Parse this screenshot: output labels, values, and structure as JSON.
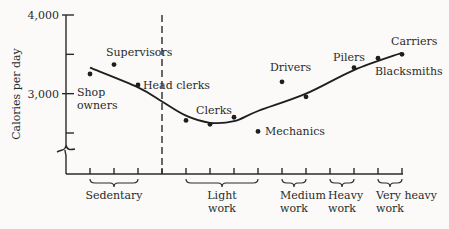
{
  "chart_data": {
    "type": "scatter",
    "title": "",
    "xlabel": "",
    "ylabel": "Calories per day",
    "y_ticks": [
      {
        "value": 4000,
        "label": "4,000"
      },
      {
        "value": 3500,
        "label": ""
      },
      {
        "value": 3000,
        "label": "3,000"
      },
      {
        "value": 2500,
        "label": ""
      }
    ],
    "ylim": [
      2500,
      4000
    ],
    "y_axis_break": true,
    "x_ticks": [
      1,
      2,
      3,
      4,
      5,
      6,
      7,
      8,
      9,
      10,
      11,
      12,
      13,
      14
    ],
    "divider_x": 4,
    "groups": [
      {
        "label": "Sedentary",
        "from": 1,
        "to": 3
      },
      {
        "label": "Light\nwork",
        "from": 5,
        "to": 8
      },
      {
        "label": "Medium\nwork",
        "from": 9,
        "to": 10
      },
      {
        "label": "Heavy\nwork",
        "from": 11,
        "to": 12
      },
      {
        "label": "Very heavy\nwork",
        "from": 13,
        "to": 14
      }
    ],
    "points": [
      {
        "x": 1,
        "y": 3250,
        "label": "Shop\nowners"
      },
      {
        "x": 2,
        "y": 3370,
        "label": "Supervisors"
      },
      {
        "x": 3,
        "y": 3110,
        "label": "Head clerks"
      },
      {
        "x": 5,
        "y": 2660,
        "label": ""
      },
      {
        "x": 6,
        "y": 2610,
        "label": "Clerks"
      },
      {
        "x": 7,
        "y": 2700,
        "label": ""
      },
      {
        "x": 8,
        "y": 2520,
        "label": "Mechanics"
      },
      {
        "x": 9,
        "y": 3150,
        "label": "Drivers"
      },
      {
        "x": 10,
        "y": 2960,
        "label": ""
      },
      {
        "x": 12,
        "y": 3330,
        "label": "Pilers"
      },
      {
        "x": 13,
        "y": 3450,
        "label": "Blacksmiths"
      },
      {
        "x": 14,
        "y": 3500,
        "label": "Carriers"
      }
    ],
    "trend_curve": [
      {
        "x": 1,
        "y": 3330
      },
      {
        "x": 3,
        "y": 3080
      },
      {
        "x": 4,
        "y": 2900
      },
      {
        "x": 5,
        "y": 2720
      },
      {
        "x": 6,
        "y": 2630
      },
      {
        "x": 7,
        "y": 2650
      },
      {
        "x": 8,
        "y": 2780
      },
      {
        "x": 10,
        "y": 3000
      },
      {
        "x": 12,
        "y": 3300
      },
      {
        "x": 14,
        "y": 3520
      }
    ],
    "grid": false,
    "legend": "none"
  }
}
